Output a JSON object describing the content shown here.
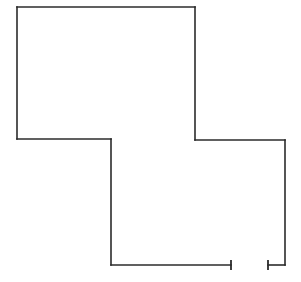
{
  "canvas": {
    "width": 301,
    "height": 282,
    "background_color": "#ffffff",
    "line_color": "#2b2b2b",
    "line_width": 1.6
  },
  "drawing": {
    "title": "Cross-shaped floor plan outline",
    "description": "Single closed polygon forming an offset cross / stepped plan, drawn in thin black line on white. The bottom wall contains an opening with jamb tick marks.",
    "shape_type": "polyline",
    "upper_block": {
      "name": "upper-left-block",
      "left": 17,
      "top": 7,
      "right": 195,
      "bottom": 139
    },
    "lower_block": {
      "name": "lower-right-block",
      "left": 111,
      "top": 139,
      "right": 285,
      "bottom": 265
    },
    "outline_points": "17,7 195,7 195,140 285,140 285,265 111,265 111,139 17,139 17,7",
    "wall_segments": [
      {
        "name": "top-wall",
        "x1": 17,
        "y1": 7,
        "x2": 195,
        "y2": 7
      },
      {
        "name": "upper-right-wall",
        "x1": 195,
        "y1": 7,
        "x2": 195,
        "y2": 140
      },
      {
        "name": "right-step-wall",
        "x1": 195,
        "y1": 140,
        "x2": 285,
        "y2": 140
      },
      {
        "name": "lower-right-wall",
        "x1": 285,
        "y1": 140,
        "x2": 285,
        "y2": 265
      },
      {
        "name": "bottom-wall-right-stub",
        "x1": 285,
        "y1": 265,
        "x2": 268,
        "y2": 265
      },
      {
        "name": "bottom-wall-left-run",
        "x1": 231,
        "y1": 265,
        "x2": 111,
        "y2": 265
      },
      {
        "name": "lower-left-wall",
        "x1": 111,
        "y1": 265,
        "x2": 111,
        "y2": 139
      },
      {
        "name": "left-step-wall",
        "x1": 111,
        "y1": 139,
        "x2": 17,
        "y2": 139
      },
      {
        "name": "upper-left-wall",
        "x1": 17,
        "y1": 139,
        "x2": 17,
        "y2": 7
      }
    ],
    "opening": {
      "name": "bottom-wall-opening",
      "wall": "bottom-wall",
      "start_x": 231,
      "end_x": 268,
      "y": 265,
      "width_px": 37,
      "jamb_tick_half_height": 5
    },
    "jamb_ticks": [
      {
        "name": "opening-jamb-left",
        "x": 231,
        "y1": 260,
        "y2": 270
      },
      {
        "name": "opening-jamb-right",
        "x": 268,
        "y1": 260,
        "y2": 270
      }
    ]
  }
}
